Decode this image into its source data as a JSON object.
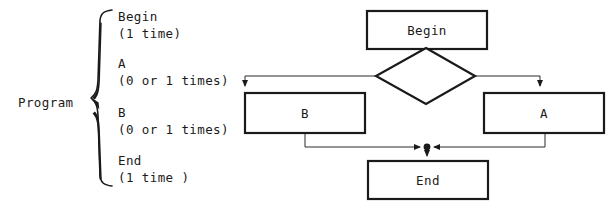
{
  "figure": {
    "brace_diagram": {
      "root_label": "Program",
      "entries": [
        {
          "name": "Begin",
          "count": "(1 time)"
        },
        {
          "name": "A",
          "count": "(0 or 1 times)"
        },
        {
          "name": "B",
          "count": "(0 or 1 times)"
        },
        {
          "name": "End",
          "count": "(1 time )"
        }
      ]
    },
    "flowchart": {
      "nodes": {
        "begin": "Begin",
        "decision": "",
        "b": "B",
        "a": "A",
        "end": "End"
      },
      "edges": [
        {
          "from": "begin",
          "to": "decision"
        },
        {
          "from": "decision",
          "to": "b"
        },
        {
          "from": "decision",
          "to": "a"
        },
        {
          "from": "b",
          "to": "junction"
        },
        {
          "from": "a",
          "to": "junction"
        },
        {
          "from": "junction",
          "to": "end"
        }
      ]
    },
    "colors": {
      "ink": "#1a1a1a",
      "paper": "#ffffff",
      "thin_line": "#3a3a3a"
    }
  }
}
